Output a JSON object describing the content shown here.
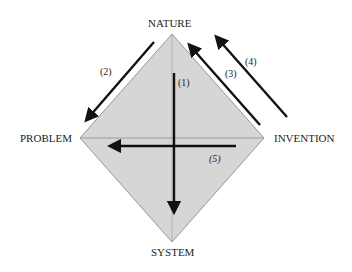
{
  "diagram": {
    "vertices": {
      "top": "NATURE",
      "left": "PROBLEM",
      "right": "INVENTION",
      "bottom": "SYSTEM"
    },
    "arrows": [
      {
        "label": "(1)",
        "from": "NATURE",
        "to": "SYSTEM"
      },
      {
        "label": "(2)",
        "from": "NATURE",
        "to": "PROBLEM"
      },
      {
        "label": "(3)",
        "from": "INVENTION",
        "to": "NATURE"
      },
      {
        "label": "(4)",
        "from": "INVENTION",
        "to": "NATURE"
      },
      {
        "label": "(5)",
        "from": "INVENTION",
        "to": "PROBLEM"
      }
    ],
    "colors": {
      "fill": "#d4d4d4",
      "fill_light": "#dcdcdc",
      "edge": "#7a7a7a",
      "arrow": "#111111"
    }
  }
}
